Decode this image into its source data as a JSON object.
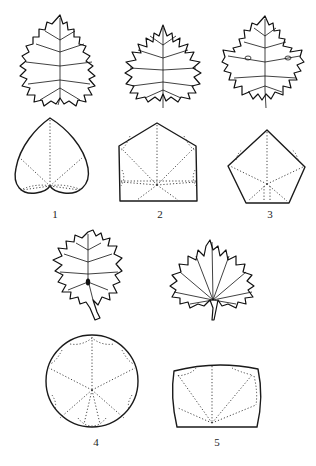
{
  "figure": {
    "panels": [
      {
        "id": 1,
        "label": "1",
        "outline_shape": "heart"
      },
      {
        "id": 2,
        "label": "2",
        "outline_shape": "truncated-pentagon"
      },
      {
        "id": 3,
        "label": "3",
        "outline_shape": "pentagon"
      },
      {
        "id": 4,
        "label": "4",
        "outline_shape": "circle"
      },
      {
        "id": 5,
        "label": "5",
        "outline_shape": "rounded-rectangle"
      }
    ],
    "colors": {
      "line": "#1a1a1a",
      "background": "#ffffff"
    }
  }
}
